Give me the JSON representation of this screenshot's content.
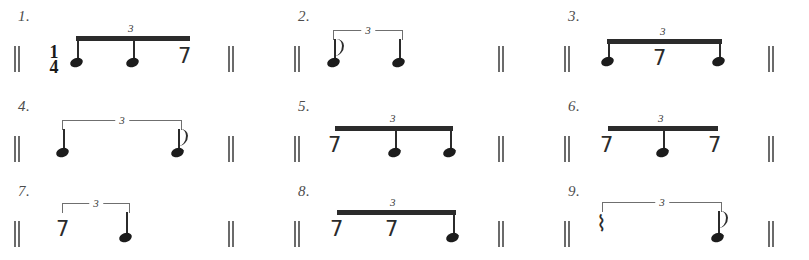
{
  "page": {
    "kind": "rhythm-exercise-worksheet",
    "ink_color": "#2b2b2b",
    "background_color": "#ffffff",
    "triplet_numeral": "3",
    "time_signature": {
      "numerator": "1",
      "denominator": "4"
    },
    "glyphs": {
      "eighth_rest": "7",
      "quarter_rest": "⌇",
      "barline": "||"
    }
  },
  "exercises": [
    {
      "number": "1.",
      "tuplet": "3",
      "grouping": "beam",
      "time_signature": "1/4",
      "open_barline": "||",
      "close_barline": "||",
      "events": [
        "note",
        "note",
        "eighth-rest"
      ]
    },
    {
      "number": "2.",
      "tuplet": "3",
      "grouping": "bracket",
      "open_barline": "||",
      "close_barline": "||",
      "events": [
        "eighth-note-flagged",
        "note",
        "silent"
      ]
    },
    {
      "number": "3.",
      "tuplet": "3",
      "grouping": "beam",
      "open_barline": "||",
      "close_barline": "||",
      "events": [
        "note",
        "eighth-rest",
        "note"
      ]
    },
    {
      "number": "4.",
      "tuplet": "3",
      "grouping": "bracket",
      "open_barline": "||",
      "close_barline": "||",
      "events": [
        "note",
        "silent",
        "eighth-note-flagged"
      ]
    },
    {
      "number": "5.",
      "tuplet": "3",
      "grouping": "beam",
      "open_barline": "||",
      "close_barline": "||",
      "events": [
        "eighth-rest",
        "note",
        "note"
      ]
    },
    {
      "number": "6.",
      "tuplet": "3",
      "grouping": "beam",
      "open_barline": "||",
      "close_barline": "||",
      "events": [
        "eighth-rest",
        "note",
        "eighth-rest"
      ]
    },
    {
      "number": "7.",
      "tuplet": "3",
      "grouping": "bracket",
      "open_barline": "||",
      "close_barline": "||",
      "events": [
        "eighth-rest",
        "note",
        "silent"
      ]
    },
    {
      "number": "8.",
      "tuplet": "3",
      "grouping": "beam",
      "open_barline": "||",
      "close_barline": "||",
      "events": [
        "eighth-rest",
        "eighth-rest",
        "note"
      ]
    },
    {
      "number": "9.",
      "tuplet": "3",
      "grouping": "bracket",
      "open_barline": "||",
      "close_barline": "||",
      "events": [
        "quarter-rest",
        "silent",
        "eighth-note-flagged"
      ]
    }
  ]
}
